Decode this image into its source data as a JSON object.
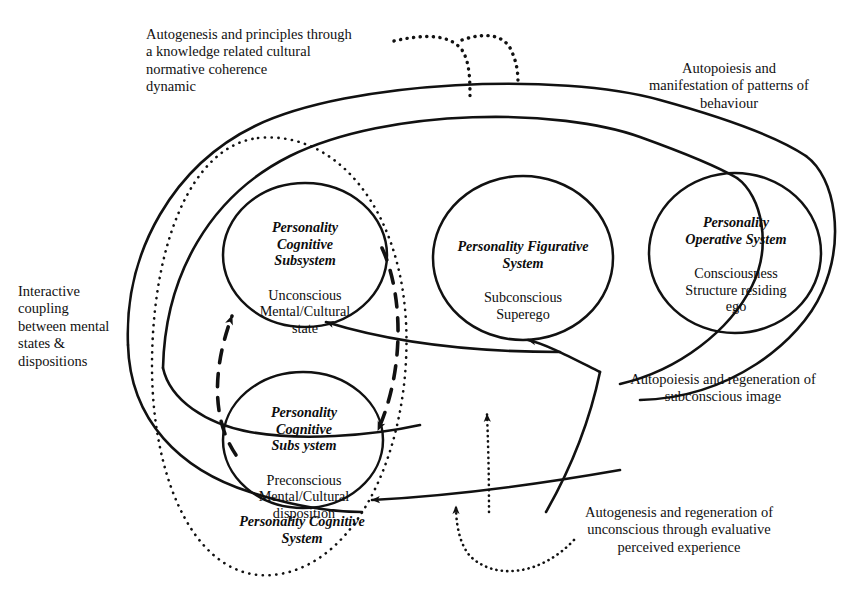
{
  "figure": {
    "type": "conceptual-diagram",
    "background": "#ffffff",
    "stroke": "#111111"
  },
  "nodes": [
    {
      "id": "personality-cognitive-subsystem-unconscious",
      "title": "Personality\nCognitive\nSubsystem",
      "body": "Unconscious\nMental/Cultural\nstate",
      "cx": 305,
      "cy": 255,
      "rx": 82,
      "ry": 72
    },
    {
      "id": "personality-cognitive-subsystem-preconscious",
      "title": "Personality\nCognitive\nSubs ystem",
      "body": "Preconscious\nMental/Cultural\ndisposition",
      "cx": 303,
      "cy": 440,
      "rx": 80,
      "ry": 68
    },
    {
      "id": "personality-figurative-system",
      "title": "Personality Figurative\nSystem",
      "body": "Subconscious\nSuperego",
      "cx": 523,
      "cy": 258,
      "rx": 90,
      "ry": 82
    },
    {
      "id": "personality-operative-system",
      "title": "Personality\nOperative System",
      "body": "Consciousness\nStructure residing\nego",
      "cx": 735,
      "cy": 253,
      "rx": 86,
      "ry": 80
    }
  ],
  "group_label": {
    "id": "personality-cognitive-system",
    "text": "Personality Cognitive\nSystem"
  },
  "annotations": [
    {
      "id": "autogenesis-principles",
      "text": "Autogenesis and principles through\na knowledge related cultural\nnormative coherence\ndynamic",
      "align": "left"
    },
    {
      "id": "autopoiesis-manifestation",
      "text": "Autopoiesis and\nmanifestation of patterns of\nbehaviour",
      "align": "center"
    },
    {
      "id": "interactive-coupling",
      "text": "Interactive\ncoupling\nbetween mental\nstates &\ndispositions",
      "align": "left"
    },
    {
      "id": "autopoiesis-regeneration-subconscious",
      "text": "Autopoiesis and regeneration of\nsubconscious image",
      "align": "center"
    },
    {
      "id": "autogenesis-regeneration-unconscious",
      "text": "Autogenesis and regeneration of\nunconscious through evaluative\nperceived experience",
      "align": "center"
    }
  ],
  "connectors": [
    {
      "id": "dotted-branch-left",
      "style": "dotted",
      "arrow": "end"
    },
    {
      "id": "dotted-branch-right",
      "style": "dotted",
      "arrow": "end"
    },
    {
      "id": "outer-envelope-upper",
      "style": "solid",
      "arrow": "end"
    },
    {
      "id": "outer-envelope-lower",
      "style": "solid",
      "arrow": "end"
    },
    {
      "id": "outer-envelope-right",
      "style": "solid",
      "arrow": "none"
    },
    {
      "id": "dashed-loop-up",
      "style": "dashed",
      "arrow": "end"
    },
    {
      "id": "dashed-loop-down",
      "style": "dashed",
      "arrow": "end"
    },
    {
      "id": "solid-to-unconscious",
      "style": "solid",
      "arrow": "end"
    },
    {
      "id": "solid-to-preconscious",
      "style": "solid",
      "arrow": "end"
    },
    {
      "id": "solid-to-figurative",
      "style": "solid",
      "arrow": "end"
    },
    {
      "id": "dotted-up-to-hub",
      "style": "dotted",
      "arrow": "end"
    },
    {
      "id": "dotted-bottom-sweep",
      "style": "dotted",
      "arrow": "end"
    },
    {
      "id": "dotted-cognitive-system-boundary",
      "style": "dotted",
      "arrow": "none"
    }
  ]
}
